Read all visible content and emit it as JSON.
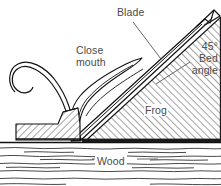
{
  "diagram": {
    "background_color": "#ffffff",
    "line_color": "#1a1a1a",
    "text_color": "#4a4a4a",
    "hatch_color": "#3a3a3a",
    "labels": {
      "blade": "Blade",
      "close_mouth_line1": "Close",
      "close_mouth_line2": "mouth",
      "bed_angle_line1": "45°",
      "bed_angle_line2": "Bed",
      "bed_angle_line3": "angle",
      "frog": "Frog",
      "wood": "Wood"
    },
    "parts": {
      "blade": "Blade",
      "frog": "Frog",
      "mouth": "Close mouth",
      "wood": "Wood",
      "shaving": "Shaving curl",
      "sole": "Plane sole",
      "toe": "Plane toe block",
      "chipbreaker": "Chipbreaker"
    }
  }
}
